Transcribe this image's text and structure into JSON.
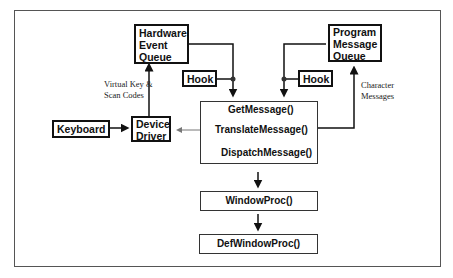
{
  "diagram": {
    "nodes": {
      "hardware_queue": {
        "line1": "Hardware",
        "line2": "Event",
        "line3": "Queue"
      },
      "program_queue": {
        "line1": "Program",
        "line2": "Message",
        "line3": "Queue"
      },
      "hook_left": "Hook",
      "hook_right": "Hook",
      "keyboard": "Keyboard",
      "device_driver": {
        "line1": "Device",
        "line2": "Driver"
      },
      "message_loop": {
        "get": "GetMessage()",
        "translate": "TranslateMessage()",
        "dispatch": "DispatchMessage()"
      },
      "window_proc": "WindowProc()",
      "def_window_proc": "DefWindowProc()"
    },
    "labels": {
      "virtual_key_1": "Virtual Key &",
      "virtual_key_2": "Scan Codes",
      "character_1": "Character",
      "character_2": "Messages"
    },
    "colors": {
      "line": "#111111",
      "frame": "#555555",
      "gray_arrow": "#777777"
    }
  }
}
